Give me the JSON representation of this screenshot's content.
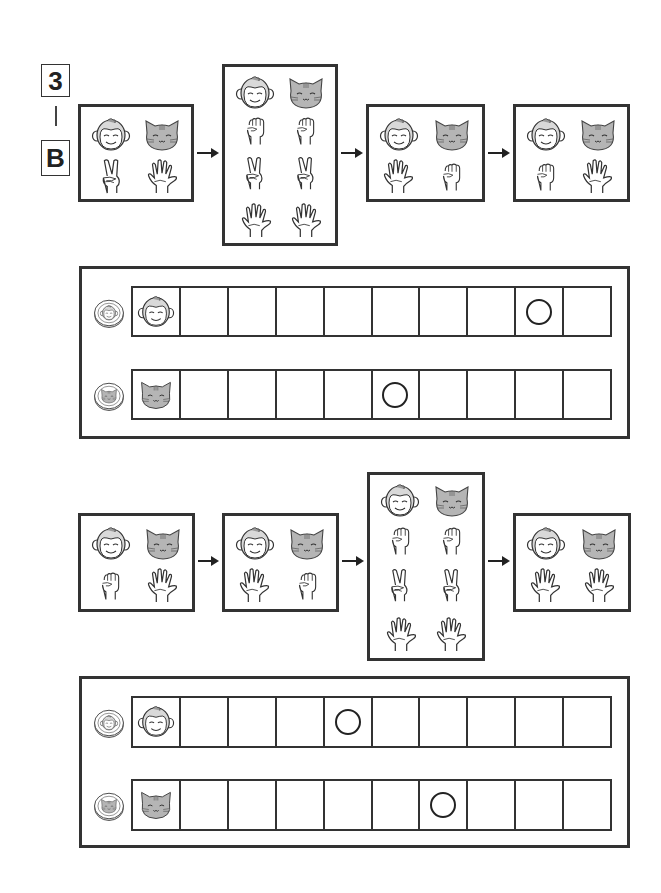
{
  "worksheet": {
    "label_number": "3",
    "label_divider": "|",
    "label_letter": "B"
  },
  "icon_defs": {
    "monkey": "monkey-face-icon",
    "cat": "cat-face-icon",
    "rock": "fist-rock-icon",
    "scissors": "peace-scissors-icon",
    "paper": "open-hand-paper-icon",
    "monkey_coin": "monkey-coin-icon",
    "cat_coin": "cat-coin-icon"
  },
  "colors": {
    "line": "#333333",
    "cat_fill": "#b5b5b5",
    "background": "#ffffff"
  },
  "sequences": [
    {
      "id": "top",
      "rounds": [
        {
          "type": "single",
          "monkey": "scissors",
          "cat": "paper"
        },
        {
          "type": "tie",
          "monkey": [
            "rock",
            "scissors",
            "paper"
          ],
          "cat": [
            "rock",
            "scissors",
            "paper"
          ]
        },
        {
          "type": "single",
          "monkey": "paper",
          "cat": "rock"
        },
        {
          "type": "single",
          "monkey": "rock",
          "cat": "paper"
        }
      ],
      "board": {
        "cells_per_track": 10,
        "monkey_track": {
          "start_icon": "monkey",
          "circle_cell": 8
        },
        "cat_track": {
          "start_icon": "cat",
          "circle_cell": 5
        }
      }
    },
    {
      "id": "bottom",
      "rounds": [
        {
          "type": "single",
          "monkey": "rock",
          "cat": "paper"
        },
        {
          "type": "single",
          "monkey": "paper",
          "cat": "rock"
        },
        {
          "type": "tie",
          "monkey": [
            "rock",
            "scissors",
            "paper"
          ],
          "cat": [
            "rock",
            "scissors",
            "paper"
          ]
        },
        {
          "type": "single",
          "monkey": "paper",
          "cat": "paper"
        }
      ],
      "board": {
        "cells_per_track": 10,
        "monkey_track": {
          "start_icon": "monkey",
          "circle_cell": 4
        },
        "cat_track": {
          "start_icon": "cat",
          "circle_cell": 6
        }
      }
    }
  ]
}
